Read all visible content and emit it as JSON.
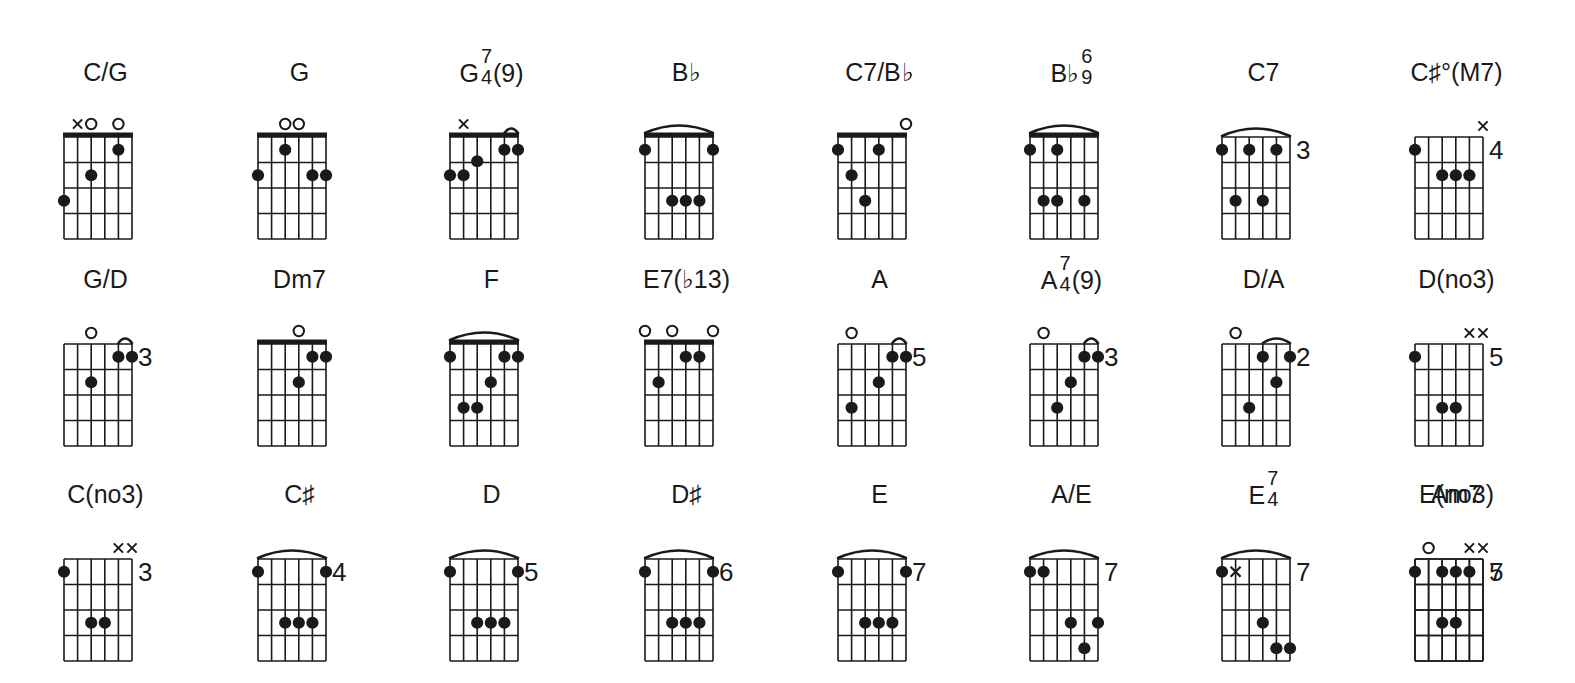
{
  "page": {
    "background_color": "#ffffff",
    "ink_color": "#1a1a1a",
    "columns": 8,
    "rows": 3,
    "strings": 6,
    "frets": 4
  },
  "legend": {
    "open_string_symbol": "o",
    "muted_string_symbol": "x",
    "finger_dot": "filled-circle",
    "barre": "arc",
    "position_marker": "fret-number-right"
  },
  "chords": [
    {
      "id": "c-over-g",
      "name": "C/G",
      "name_parts": {
        "root": "C/G",
        "upper": "",
        "lower": "",
        "tail": ""
      },
      "row": 0,
      "col": 0,
      "nut": true,
      "fret_label": "",
      "top_markers": [
        "",
        "x",
        "o",
        "",
        "o",
        ""
      ],
      "inner_markers": [],
      "barre": null,
      "dots": [
        {
          "string": 6,
          "fret": 3
        },
        {
          "string": 4,
          "fret": 2
        },
        {
          "string": 2,
          "fret": 1
        }
      ]
    },
    {
      "id": "g",
      "name": "G",
      "name_parts": {
        "root": "G",
        "upper": "",
        "lower": "",
        "tail": ""
      },
      "row": 0,
      "col": 1,
      "nut": true,
      "fret_label": "",
      "top_markers": [
        "",
        "",
        "o",
        "o",
        "",
        ""
      ],
      "inner_markers": [],
      "barre": null,
      "dots": [
        {
          "string": 6,
          "fret": 2
        },
        {
          "string": 4,
          "fret": 1
        },
        {
          "string": 2,
          "fret": 2
        },
        {
          "string": 1,
          "fret": 2
        }
      ]
    },
    {
      "id": "g-7-4-9",
      "name": "G 7/4 (9)",
      "name_parts": {
        "root": "G",
        "upper": "7",
        "lower": "4",
        "tail": "(9)"
      },
      "row": 0,
      "col": 2,
      "nut": true,
      "fret_label": "",
      "top_markers": [
        "",
        "x",
        "",
        "",
        "",
        ""
      ],
      "inner_markers": [],
      "barre": {
        "from_string": 2,
        "to_string": 1,
        "fret": 1
      },
      "dots": [
        {
          "string": 6,
          "fret": 2
        },
        {
          "string": 5,
          "fret": 2
        },
        {
          "string": 4,
          "fret": 1.45
        },
        {
          "string": 2,
          "fret": 1
        },
        {
          "string": 1,
          "fret": 1
        }
      ]
    },
    {
      "id": "b-flat",
      "name": "B♭",
      "name_parts": {
        "root": "B",
        "upper": "",
        "lower": "",
        "tail": "♭"
      },
      "row": 0,
      "col": 3,
      "nut": true,
      "fret_label": "",
      "top_markers": [
        "",
        "",
        "",
        "",
        "",
        ""
      ],
      "inner_markers": [],
      "barre": {
        "from_string": 6,
        "to_string": 1,
        "fret": 1
      },
      "dots": [
        {
          "string": 6,
          "fret": 1
        },
        {
          "string": 4,
          "fret": 3
        },
        {
          "string": 3,
          "fret": 3
        },
        {
          "string": 2,
          "fret": 3
        },
        {
          "string": 1,
          "fret": 1
        }
      ]
    },
    {
      "id": "c7-over-b-flat",
      "name": "C7/B♭",
      "name_parts": {
        "root": "C7/B",
        "upper": "",
        "lower": "",
        "tail": "♭"
      },
      "row": 0,
      "col": 4,
      "nut": true,
      "fret_label": "",
      "top_markers": [
        "",
        "",
        "",
        "",
        "",
        "o"
      ],
      "inner_markers": [],
      "barre": null,
      "dots": [
        {
          "string": 6,
          "fret": 1
        },
        {
          "string": 5,
          "fret": 2
        },
        {
          "string": 4,
          "fret": 3
        },
        {
          "string": 3,
          "fret": 1
        }
      ]
    },
    {
      "id": "b-flat-6-9",
      "name": "B♭ 6/9",
      "name_parts": {
        "root": "B♭",
        "upper": "6",
        "lower": "9",
        "tail": ""
      },
      "row": 0,
      "col": 5,
      "nut": true,
      "fret_label": "",
      "top_markers": [
        "",
        "",
        "",
        "",
        "",
        ""
      ],
      "inner_markers": [],
      "barre": {
        "from_string": 6,
        "to_string": 1,
        "fret": 1
      },
      "dots": [
        {
          "string": 6,
          "fret": 1
        },
        {
          "string": 4,
          "fret": 1
        },
        {
          "string": 5,
          "fret": 3
        },
        {
          "string": 4,
          "fret": 3
        },
        {
          "string": 2,
          "fret": 3
        }
      ]
    },
    {
      "id": "c7",
      "name": "C7",
      "name_parts": {
        "root": "C7",
        "upper": "",
        "lower": "",
        "tail": ""
      },
      "row": 0,
      "col": 6,
      "nut": false,
      "fret_label": "3",
      "top_markers": [
        "",
        "",
        "",
        "",
        "",
        ""
      ],
      "inner_markers": [],
      "barre": {
        "from_string": 6,
        "to_string": 1,
        "fret": 1
      },
      "dots": [
        {
          "string": 6,
          "fret": 1
        },
        {
          "string": 4,
          "fret": 1
        },
        {
          "string": 2,
          "fret": 1
        },
        {
          "string": 5,
          "fret": 3
        },
        {
          "string": 3,
          "fret": 3
        }
      ]
    },
    {
      "id": "c-sharp-dim-M7",
      "name": "C♯°(M7)",
      "name_parts": {
        "root": "C♯°(M7)",
        "upper": "",
        "lower": "",
        "tail": ""
      },
      "row": 0,
      "col": 7,
      "nut": false,
      "fret_label": "4",
      "top_markers": [
        "",
        "",
        "",
        "",
        "",
        "x"
      ],
      "inner_markers": [],
      "barre": null,
      "dots": [
        {
          "string": 6,
          "fret": 1
        },
        {
          "string": 4,
          "fret": 2
        },
        {
          "string": 3,
          "fret": 2
        },
        {
          "string": 2,
          "fret": 2
        }
      ]
    },
    {
      "id": "g-over-d",
      "name": "G/D",
      "name_parts": {
        "root": "G/D",
        "upper": "",
        "lower": "",
        "tail": ""
      },
      "row": 1,
      "col": 0,
      "nut": false,
      "fret_label": "3",
      "top_markers": [
        "",
        "",
        "o",
        "",
        "",
        ""
      ],
      "inner_markers": [],
      "barre": {
        "from_string": 2,
        "to_string": 1,
        "fret": 1
      },
      "dots": [
        {
          "string": 2,
          "fret": 1
        },
        {
          "string": 1,
          "fret": 1
        },
        {
          "string": 4,
          "fret": 2
        }
      ]
    },
    {
      "id": "dm7",
      "name": "Dm7",
      "name_parts": {
        "root": "Dm7",
        "upper": "",
        "lower": "",
        "tail": ""
      },
      "row": 1,
      "col": 1,
      "nut": true,
      "fret_label": "",
      "top_markers": [
        "",
        "",
        "",
        "o",
        "",
        ""
      ],
      "inner_markers": [],
      "barre": null,
      "dots": [
        {
          "string": 2,
          "fret": 1
        },
        {
          "string": 1,
          "fret": 1
        },
        {
          "string": 3,
          "fret": 2
        }
      ]
    },
    {
      "id": "f",
      "name": "F",
      "name_parts": {
        "root": "F",
        "upper": "",
        "lower": "",
        "tail": ""
      },
      "row": 1,
      "col": 2,
      "nut": true,
      "fret_label": "",
      "top_markers": [
        "",
        "",
        "",
        "",
        "",
        ""
      ],
      "inner_markers": [],
      "barre": {
        "from_string": 6,
        "to_string": 1,
        "fret": 1
      },
      "dots": [
        {
          "string": 6,
          "fret": 1
        },
        {
          "string": 2,
          "fret": 1
        },
        {
          "string": 1,
          "fret": 1
        },
        {
          "string": 3,
          "fret": 2
        },
        {
          "string": 5,
          "fret": 3
        },
        {
          "string": 4,
          "fret": 3
        }
      ]
    },
    {
      "id": "e7-flat13",
      "name": "E7(♭13)",
      "name_parts": {
        "root": "E7(♭13)",
        "upper": "",
        "lower": "",
        "tail": ""
      },
      "row": 1,
      "col": 3,
      "nut": true,
      "fret_label": "",
      "top_markers": [
        "o",
        "",
        "o",
        "",
        "",
        "o"
      ],
      "inner_markers": [],
      "barre": null,
      "dots": [
        {
          "string": 3,
          "fret": 1
        },
        {
          "string": 2,
          "fret": 1
        },
        {
          "string": 5,
          "fret": 2
        }
      ]
    },
    {
      "id": "a",
      "name": "A",
      "name_parts": {
        "root": "A",
        "upper": "",
        "lower": "",
        "tail": ""
      },
      "row": 1,
      "col": 4,
      "nut": false,
      "fret_label": "5",
      "top_markers": [
        "",
        "o",
        "",
        "",
        "",
        ""
      ],
      "inner_markers": [],
      "barre": {
        "from_string": 2,
        "to_string": 1,
        "fret": 1
      },
      "dots": [
        {
          "string": 2,
          "fret": 1
        },
        {
          "string": 1,
          "fret": 1
        },
        {
          "string": 3,
          "fret": 2
        },
        {
          "string": 5,
          "fret": 3
        }
      ]
    },
    {
      "id": "a-7-4-9",
      "name": "A 7/4 (9)",
      "name_parts": {
        "root": "A",
        "upper": "7",
        "lower": "4",
        "tail": "(9)"
      },
      "row": 1,
      "col": 5,
      "nut": false,
      "fret_label": "3",
      "top_markers": [
        "",
        "o",
        "",
        "",
        "",
        ""
      ],
      "inner_markers": [],
      "barre": {
        "from_string": 2,
        "to_string": 1,
        "fret": 1
      },
      "dots": [
        {
          "string": 2,
          "fret": 1
        },
        {
          "string": 1,
          "fret": 1
        },
        {
          "string": 3,
          "fret": 2
        },
        {
          "string": 4,
          "fret": 3
        }
      ]
    },
    {
      "id": "d-over-a",
      "name": "D/A",
      "name_parts": {
        "root": "D/A",
        "upper": "",
        "lower": "",
        "tail": ""
      },
      "row": 1,
      "col": 6,
      "nut": false,
      "fret_label": "2",
      "top_markers": [
        "",
        "o",
        "",
        "",
        "",
        ""
      ],
      "inner_markers": [],
      "barre": {
        "from_string": 3,
        "to_string": 1,
        "fret": 1
      },
      "dots": [
        {
          "string": 3,
          "fret": 1
        },
        {
          "string": 1,
          "fret": 1
        },
        {
          "string": 2,
          "fret": 2
        },
        {
          "string": 4,
          "fret": 3
        }
      ]
    },
    {
      "id": "d-no3",
      "name": "D(no3)",
      "name_parts": {
        "root": "D(no3)",
        "upper": "",
        "lower": "",
        "tail": ""
      },
      "row": 1,
      "col": 7,
      "nut": false,
      "fret_label": "5",
      "top_markers": [
        "",
        "",
        "",
        "",
        "x",
        "x"
      ],
      "inner_markers": [],
      "barre": null,
      "dots": [
        {
          "string": 6,
          "fret": 1
        },
        {
          "string": 4,
          "fret": 3
        },
        {
          "string": 3,
          "fret": 3
        }
      ]
    },
    {
      "id": "c-no3",
      "name": "C(no3)",
      "name_parts": {
        "root": "C(no3)",
        "upper": "",
        "lower": "",
        "tail": ""
      },
      "row": 2,
      "col": 0,
      "nut": false,
      "fret_label": "3",
      "top_markers": [
        "",
        "",
        "",
        "",
        "x",
        "x"
      ],
      "inner_markers": [],
      "barre": null,
      "dots": [
        {
          "string": 6,
          "fret": 1
        },
        {
          "string": 4,
          "fret": 3
        },
        {
          "string": 3,
          "fret": 3
        }
      ]
    },
    {
      "id": "c-sharp",
      "name": "C♯",
      "name_parts": {
        "root": "C♯",
        "upper": "",
        "lower": "",
        "tail": ""
      },
      "row": 2,
      "col": 1,
      "nut": false,
      "fret_label": "4",
      "top_markers": [
        "",
        "",
        "",
        "",
        "",
        ""
      ],
      "inner_markers": [],
      "barre": {
        "from_string": 6,
        "to_string": 1,
        "fret": 1
      },
      "dots": [
        {
          "string": 6,
          "fret": 1
        },
        {
          "string": 1,
          "fret": 1
        },
        {
          "string": 4,
          "fret": 3
        },
        {
          "string": 3,
          "fret": 3
        },
        {
          "string": 2,
          "fret": 3
        }
      ]
    },
    {
      "id": "d",
      "name": "D",
      "name_parts": {
        "root": "D",
        "upper": "",
        "lower": "",
        "tail": ""
      },
      "row": 2,
      "col": 2,
      "nut": false,
      "fret_label": "5",
      "top_markers": [
        "",
        "",
        "",
        "",
        "",
        ""
      ],
      "inner_markers": [],
      "barre": {
        "from_string": 6,
        "to_string": 1,
        "fret": 1
      },
      "dots": [
        {
          "string": 6,
          "fret": 1
        },
        {
          "string": 1,
          "fret": 1
        },
        {
          "string": 4,
          "fret": 3
        },
        {
          "string": 3,
          "fret": 3
        },
        {
          "string": 2,
          "fret": 3
        }
      ]
    },
    {
      "id": "d-sharp",
      "name": "D♯",
      "name_parts": {
        "root": "D♯",
        "upper": "",
        "lower": "",
        "tail": ""
      },
      "row": 2,
      "col": 3,
      "nut": false,
      "fret_label": "6",
      "top_markers": [
        "",
        "",
        "",
        "",
        "",
        ""
      ],
      "inner_markers": [],
      "barre": {
        "from_string": 6,
        "to_string": 1,
        "fret": 1
      },
      "dots": [
        {
          "string": 6,
          "fret": 1
        },
        {
          "string": 1,
          "fret": 1
        },
        {
          "string": 4,
          "fret": 3
        },
        {
          "string": 3,
          "fret": 3
        },
        {
          "string": 2,
          "fret": 3
        }
      ]
    },
    {
      "id": "e",
      "name": "E",
      "name_parts": {
        "root": "E",
        "upper": "",
        "lower": "",
        "tail": ""
      },
      "row": 2,
      "col": 4,
      "nut": false,
      "fret_label": "7",
      "top_markers": [
        "",
        "",
        "",
        "",
        "",
        ""
      ],
      "inner_markers": [],
      "barre": {
        "from_string": 6,
        "to_string": 1,
        "fret": 1
      },
      "dots": [
        {
          "string": 6,
          "fret": 1
        },
        {
          "string": 1,
          "fret": 1
        },
        {
          "string": 4,
          "fret": 3
        },
        {
          "string": 3,
          "fret": 3
        },
        {
          "string": 2,
          "fret": 3
        }
      ]
    },
    {
      "id": "a-over-e",
      "name": "A/E",
      "name_parts": {
        "root": "A/E",
        "upper": "",
        "lower": "",
        "tail": ""
      },
      "row": 2,
      "col": 5,
      "nut": false,
      "fret_label": "7",
      "top_markers": [
        "",
        "",
        "",
        "",
        "",
        ""
      ],
      "inner_markers": [],
      "barre": {
        "from_string": 6,
        "to_string": 1,
        "fret": 1
      },
      "dots": [
        {
          "string": 6,
          "fret": 1
        },
        {
          "string": 5,
          "fret": 1
        },
        {
          "string": 3,
          "fret": 3
        },
        {
          "string": 1,
          "fret": 3
        },
        {
          "string": 2,
          "fret": 4
        }
      ]
    },
    {
      "id": "e-7-4",
      "name": "E 7/4",
      "name_parts": {
        "root": "E",
        "upper": "7",
        "lower": "4",
        "tail": ""
      },
      "row": 2,
      "col": 6,
      "nut": false,
      "fret_label": "7",
      "top_markers": [
        "",
        "",
        "",
        "",
        "",
        ""
      ],
      "inner_markers": [
        {
          "string": 5,
          "fret": 1,
          "symbol": "x"
        }
      ],
      "barre": {
        "from_string": 6,
        "to_string": 1,
        "fret": 1
      },
      "dots": [
        {
          "string": 6,
          "fret": 1
        },
        {
          "string": 3,
          "fret": 3
        },
        {
          "string": 2,
          "fret": 4
        },
        {
          "string": 1,
          "fret": 4
        }
      ]
    },
    {
      "id": "am7",
      "name": "Am7",
      "name_parts": {
        "root": "Am7",
        "upper": "",
        "lower": "",
        "tail": ""
      },
      "row": 2,
      "col": 7,
      "nut": false,
      "fret_label": "5",
      "top_markers": [
        "",
        "o",
        "",
        "",
        "",
        ""
      ],
      "inner_markers": [],
      "barre": null,
      "dots": [
        {
          "string": 4,
          "fret": 1
        },
        {
          "string": 3,
          "fret": 1
        },
        {
          "string": 2,
          "fret": 1
        }
      ]
    },
    {
      "id": "e-no3",
      "name": "E(no3)",
      "name_parts": {
        "root": "E(no3)",
        "upper": "",
        "lower": "",
        "tail": ""
      },
      "row": 2,
      "col": 8,
      "nut": false,
      "fret_label": "7",
      "top_markers": [
        "",
        "",
        "",
        "",
        "x",
        "x"
      ],
      "inner_markers": [],
      "barre": null,
      "dots": [
        {
          "string": 6,
          "fret": 1
        },
        {
          "string": 4,
          "fret": 3
        },
        {
          "string": 3,
          "fret": 3
        }
      ]
    }
  ]
}
